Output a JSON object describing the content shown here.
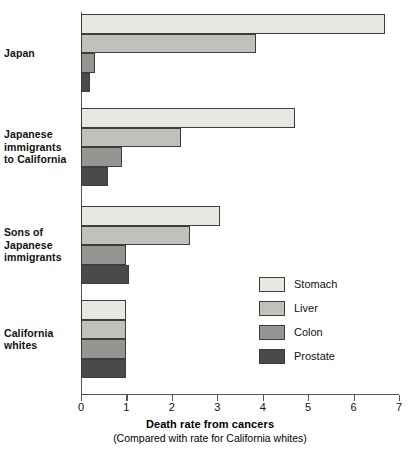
{
  "chart_data": {
    "type": "bar",
    "orientation": "horizontal",
    "title": "",
    "xlabel": "Death rate from cancers",
    "xsublabel": "(Compared with rate for California whites)",
    "ylabel": "",
    "xlim": [
      0,
      7
    ],
    "xticks": [
      0,
      1,
      2,
      3,
      4,
      5,
      6,
      7
    ],
    "xtick_labels": [
      "0",
      "1",
      "2",
      "3",
      "4",
      "5",
      "6",
      "7"
    ],
    "grid": false,
    "legend_position": "inside-right",
    "categories": [
      "Japan",
      "Japanese immigrants to California",
      "Sons of Japanese immigrants",
      "California whites"
    ],
    "series": [
      {
        "name": "Stomach",
        "color": "#e8e8e2",
        "values": [
          6.7,
          4.7,
          3.05,
          1.0
        ]
      },
      {
        "name": "Liver",
        "color": "#c1c1bc",
        "values": [
          3.85,
          2.2,
          2.4,
          1.0
        ]
      },
      {
        "name": "Colon",
        "color": "#949490",
        "values": [
          0.3,
          0.9,
          1.0,
          1.0
        ]
      },
      {
        "name": "Prostate",
        "color": "#4a4a4a",
        "values": [
          0.2,
          0.6,
          1.05,
          1.0
        ]
      }
    ]
  },
  "category_labels": [
    {
      "lines": [
        "Japan"
      ]
    },
    {
      "lines": [
        "Japanese",
        "immigrants",
        "to California"
      ]
    },
    {
      "lines": [
        "Sons of",
        "Japanese",
        "immigrants"
      ]
    },
    {
      "lines": [
        "California",
        "whites"
      ]
    }
  ],
  "legend": {
    "items": [
      {
        "label": "Stomach",
        "color": "#e8e8e2"
      },
      {
        "label": "Liver",
        "color": "#c1c1bc"
      },
      {
        "label": "Colon",
        "color": "#949490"
      },
      {
        "label": "Prostate",
        "color": "#4a4a4a"
      }
    ]
  },
  "axis": {
    "title": "Death rate from cancers",
    "subtitle": "(Compared with rate for California whites)"
  },
  "layout": {
    "plot_left": 81,
    "plot_top": 12,
    "plot_width": 318,
    "group_tops": [
      14,
      108,
      206,
      300
    ],
    "bar_height": 19.5,
    "group_gap": 8
  }
}
